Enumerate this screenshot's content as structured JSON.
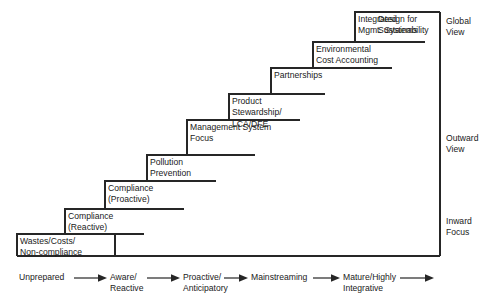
{
  "diagram": {
    "line_color": "#262626",
    "text_color": "#1a1a1a",
    "background": "#ffffff",
    "steps": [
      {
        "id": "wastes-costs-non-compliance",
        "lines": [
          "Wastes/Costs/",
          "Non-compliance"
        ]
      },
      {
        "id": "compliance-reactive",
        "lines": [
          "Compliance",
          "(Reactive)"
        ]
      },
      {
        "id": "compliance-proactive",
        "lines": [
          "Compliance",
          "(Proactive)"
        ]
      },
      {
        "id": "pollution-prevention",
        "lines": [
          "Pollution",
          "Prevention"
        ]
      },
      {
        "id": "management-system-focus",
        "lines": [
          "Management System",
          "Focus"
        ]
      },
      {
        "id": "product-stewardship",
        "lines": [
          "Product",
          "Stewardship/",
          "LCA/DFE"
        ]
      },
      {
        "id": "partnerships",
        "lines": [
          "Partnerships"
        ]
      },
      {
        "id": "environmental-cost-accounting",
        "lines": [
          "Environmental",
          "Cost Accounting"
        ]
      },
      {
        "id": "integrated-mgmt-systems",
        "lines": [
          "Integrated",
          "Mgmt. Systems"
        ]
      },
      {
        "id": "design-for-sustainability",
        "lines": [
          "Design for",
          "Sustainability"
        ]
      }
    ],
    "side_labels": [
      {
        "id": "global-view",
        "lines": [
          "Global",
          "View"
        ]
      },
      {
        "id": "outward-view",
        "lines": [
          "Outward",
          "View"
        ]
      },
      {
        "id": "inward-focus",
        "lines": [
          "Inward",
          "Focus"
        ]
      }
    ],
    "axis": [
      {
        "id": "unprepared",
        "lines": [
          "Unprepared"
        ]
      },
      {
        "id": "aware-reactive",
        "lines": [
          "Aware/",
          "Reactive"
        ]
      },
      {
        "id": "proactive-anticipatory",
        "lines": [
          "Proactive/",
          "Anticipatory"
        ]
      },
      {
        "id": "mainstreaming",
        "lines": [
          "Mainstreaming"
        ]
      },
      {
        "id": "mature-highly-integrative",
        "lines": [
          "Mature/Highly",
          "Integrative"
        ]
      }
    ]
  }
}
